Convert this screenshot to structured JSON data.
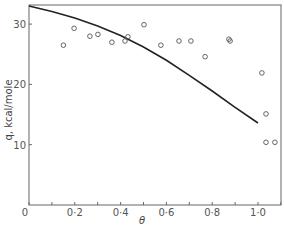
{
  "chart_data": {
    "type": "scatter",
    "title": "",
    "xlabel": "θ",
    "ylabel": "q, kcal/mole",
    "xlim": [
      0,
      1.1
    ],
    "ylim": [
      0,
      33
    ],
    "grid": false,
    "x_ticks": [
      "0",
      "0·2",
      "0·4",
      "0·6",
      "0·8",
      "1·0"
    ],
    "y_ticks": [
      "10",
      "20",
      "30"
    ],
    "series": [
      {
        "name": "experimental",
        "style": "open-circle",
        "points": [
          [
            0.15,
            26.5
          ],
          [
            0.197,
            29.3
          ],
          [
            0.266,
            28.0
          ],
          [
            0.301,
            28.3
          ],
          [
            0.362,
            27.0
          ],
          [
            0.419,
            27.2
          ],
          [
            0.432,
            27.9
          ],
          [
            0.502,
            29.9
          ],
          [
            0.576,
            26.5
          ],
          [
            0.655,
            27.2
          ],
          [
            0.707,
            27.2
          ],
          [
            0.769,
            24.6
          ],
          [
            0.873,
            27.5
          ],
          [
            0.878,
            27.2
          ],
          [
            1.017,
            21.9
          ],
          [
            1.035,
            15.1
          ],
          [
            1.035,
            10.4
          ],
          [
            1.074,
            10.4
          ]
        ]
      },
      {
        "name": "theoretical",
        "style": "line",
        "points": [
          [
            0.0,
            33.0
          ],
          [
            0.1,
            32.1
          ],
          [
            0.2,
            31.0
          ],
          [
            0.3,
            29.7
          ],
          [
            0.4,
            28.1
          ],
          [
            0.5,
            26.2
          ],
          [
            0.6,
            24.0
          ],
          [
            0.7,
            21.5
          ],
          [
            0.8,
            18.9
          ],
          [
            0.9,
            16.2
          ],
          [
            1.0,
            13.6
          ]
        ]
      }
    ]
  }
}
